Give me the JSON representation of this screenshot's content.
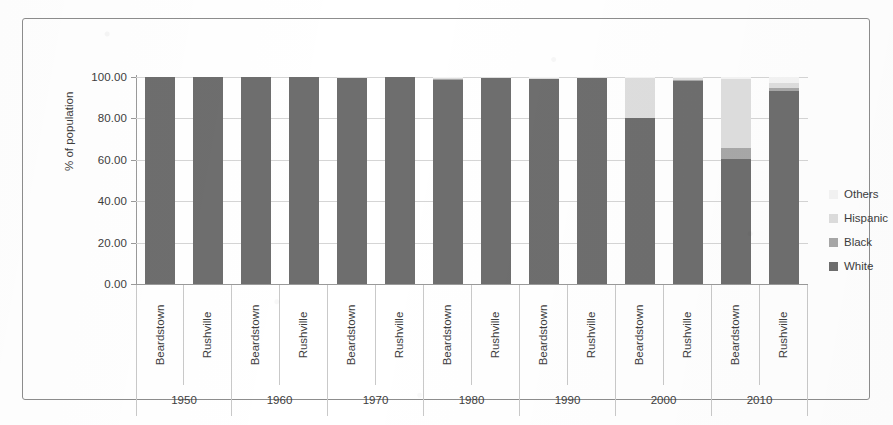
{
  "chart_data": {
    "type": "bar",
    "subtype": "stacked-column",
    "title": "",
    "xlabel": "",
    "ylabel": "% of population",
    "ylim": [
      0,
      100
    ],
    "ytick_labels": [
      "0.00",
      "20.00",
      "40.00",
      "60.00",
      "80.00",
      "100.00"
    ],
    "ytick_values": [
      0,
      20,
      40,
      60,
      80,
      100
    ],
    "grid": true,
    "legend_position": "right",
    "groups": [
      "1950",
      "1960",
      "1970",
      "1980",
      "1990",
      "2000",
      "2010"
    ],
    "categories": [
      "Beardstown",
      "Rushville",
      "Beardstown",
      "Rushville",
      "Beardstown",
      "Rushville",
      "Beardstown",
      "Rushville",
      "Beardstown",
      "Rushville",
      "Beardstown",
      "Rushville",
      "Beardstown",
      "Rushville"
    ],
    "series": [
      {
        "name": "White",
        "color": "#6e6e6e",
        "values": [
          100.0,
          100.0,
          99.8,
          100.0,
          99.5,
          99.8,
          98.6,
          99.4,
          98.8,
          99.3,
          80.0,
          98.2,
          60.5,
          93.3
        ]
      },
      {
        "name": "Black",
        "color": "#a8a8a8",
        "values": [
          0.0,
          0.0,
          0.0,
          0.0,
          0.2,
          0.0,
          0.4,
          0.2,
          0.3,
          0.2,
          0.4,
          0.3,
          5.0,
          1.2
        ]
      },
      {
        "name": "Hispanic",
        "color": "#dedede",
        "values": [
          0.0,
          0.0,
          0.0,
          0.0,
          0.2,
          0.1,
          0.5,
          0.2,
          0.5,
          0.3,
          19.2,
          0.9,
          33.5,
          2.5
        ]
      },
      {
        "name": "Others",
        "color": "#f4f4f4",
        "values": [
          0.0,
          0.0,
          0.2,
          0.0,
          0.1,
          0.1,
          0.5,
          0.2,
          0.4,
          0.2,
          0.4,
          0.6,
          1.0,
          3.0
        ]
      }
    ]
  },
  "legend": {
    "entries": [
      {
        "label": "Others",
        "color": "#f4f4f4"
      },
      {
        "label": "Hispanic",
        "color": "#dedede"
      },
      {
        "label": "Black",
        "color": "#a8a8a8"
      },
      {
        "label": "White",
        "color": "#6e6e6e"
      }
    ]
  },
  "colors": {
    "frame_border": "#8d8d8d",
    "gridline": "#d5d5d5",
    "axis_line": "#9a9a9a",
    "text": "#3d3d3d",
    "background": "#ffffff"
  }
}
